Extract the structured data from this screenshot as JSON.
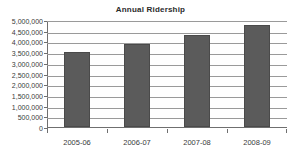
{
  "chart_data": {
    "type": "bar",
    "title": "Annual Ridership",
    "xlabel": "",
    "ylabel": "",
    "categories": [
      "2005-06",
      "2006-07",
      "2007-08",
      "2008-09"
    ],
    "values": [
      3500000,
      3870000,
      4290000,
      4750000
    ],
    "series": [
      {
        "name": "Annual Ridership",
        "values": [
          3500000,
          3870000,
          4290000,
          4750000
        ]
      }
    ],
    "ylim": [
      0,
      5000000
    ],
    "ytick_values": [
      0,
      500000,
      1000000,
      1500000,
      2000000,
      2500000,
      3000000,
      3500000,
      4000000,
      4500000,
      5000000
    ],
    "ytick_labels": [
      "0",
      "500,000",
      "1,000,000",
      "1,500,000",
      "2,000,000",
      "2,500,000",
      "3,000,000",
      "3,500,000",
      "4,000,000",
      "4,500,000",
      "5,000,000"
    ],
    "grid": true,
    "legend": false,
    "legend_position": "none",
    "colors": {
      "bar_fill": "#5b5b5b",
      "bar_edge": "#4a4a4a",
      "gridline": "#9a9a9a",
      "axis": "#6f6f6f",
      "text": "#3a3a3a",
      "title": "#2b2b2b",
      "background": "#ffffff"
    }
  }
}
